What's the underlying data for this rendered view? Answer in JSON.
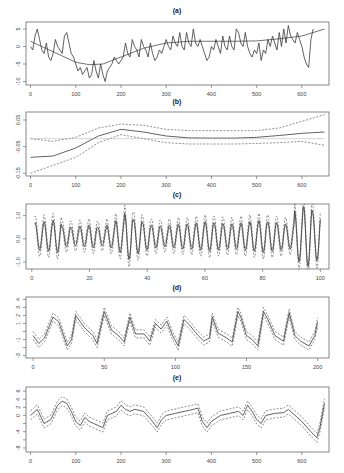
{
  "chart_data": [
    {
      "panel": "(a)",
      "type": "line",
      "title": "(a)",
      "xlabel": "",
      "ylabel": "",
      "xlim": [
        -10,
        660
      ],
      "ylim": [
        -11,
        7
      ],
      "xticks": [
        0,
        100,
        200,
        300,
        400,
        500,
        600
      ],
      "yticks": [
        5,
        0,
        -5,
        -10
      ],
      "grid": false,
      "box": {
        "x0": 26,
        "y0": 22,
        "x1": 329,
        "y1": 85
      },
      "series": [
        {
          "name": "observed",
          "style": "main",
          "x": [
            0,
            5,
            10,
            15,
            20,
            25,
            30,
            35,
            40,
            45,
            50,
            55,
            60,
            65,
            70,
            75,
            80,
            85,
            90,
            95,
            100,
            105,
            110,
            115,
            120,
            125,
            130,
            135,
            140,
            145,
            150,
            155,
            160,
            165,
            170,
            175,
            180,
            185,
            190,
            195,
            200,
            205,
            210,
            215,
            220,
            225,
            230,
            235,
            240,
            245,
            250,
            255,
            260,
            265,
            270,
            275,
            280,
            285,
            290,
            295,
            300,
            305,
            310,
            315,
            320,
            325,
            330,
            335,
            340,
            345,
            350,
            355,
            360,
            365,
            370,
            375,
            380,
            385,
            390,
            395,
            400,
            405,
            410,
            415,
            420,
            425,
            430,
            435,
            440,
            445,
            450,
            455,
            460,
            465,
            470,
            475,
            480,
            485,
            490,
            495,
            500,
            505,
            510,
            515,
            520,
            525,
            530,
            535,
            540,
            545,
            550,
            555,
            560,
            565,
            570,
            575,
            580,
            585,
            590,
            595,
            600,
            605,
            610,
            615,
            620,
            625,
            630,
            635,
            640,
            645,
            650
          ],
          "values": [
            0,
            -1,
            3,
            5,
            2,
            -1,
            -2,
            1,
            -3,
            -4,
            -2,
            2,
            0,
            -1,
            -2,
            3,
            4,
            1,
            -2,
            -3,
            -5,
            -7,
            -6,
            -8,
            -7,
            -6,
            -9,
            -8,
            -4,
            -7,
            -9,
            -5,
            -8,
            -10,
            -7,
            -6,
            -5,
            -3,
            -4,
            -5,
            -4,
            -3,
            1,
            -2,
            -3,
            2,
            0,
            -1,
            -3,
            2,
            0,
            -1,
            -3,
            1,
            -2,
            -4,
            -3,
            -1,
            -2,
            0,
            2,
            0,
            -1,
            3,
            1,
            0,
            4,
            0,
            -1,
            4,
            1,
            0,
            5,
            1,
            0,
            2,
            0,
            -2,
            -4,
            -3,
            0,
            -1,
            2,
            0,
            -2,
            3,
            0,
            -1,
            3,
            0,
            -1,
            5,
            4,
            1,
            0,
            4,
            0,
            -2,
            -3,
            -1,
            -2,
            1,
            -4,
            -1,
            -2,
            2,
            0,
            3,
            1,
            -1,
            4,
            0,
            5,
            1,
            6,
            3,
            2,
            1,
            4,
            2,
            0,
            -3,
            -5,
            -6,
            2,
            5
          ]
        },
        {
          "name": "trend",
          "style": "trend",
          "x": [
            0,
            50,
            100,
            130,
            160,
            200,
            250,
            300,
            350,
            400,
            450,
            500,
            550,
            600,
            650
          ],
          "values": [
            1.5,
            -1.5,
            -4.5,
            -5.2,
            -5,
            -3,
            -0.5,
            1,
            1.5,
            1.5,
            1.5,
            1.6,
            2.2,
            3,
            5
          ]
        }
      ]
    },
    {
      "panel": "(b)",
      "type": "line",
      "title": "(b)",
      "xlabel": "",
      "ylabel": "",
      "xlim": [
        -10,
        660
      ],
      "ylim": [
        -0.16,
        0.08
      ],
      "xticks": [
        0,
        100,
        200,
        300,
        400,
        500,
        600
      ],
      "yticks": [
        0.05,
        -0.05,
        -0.15
      ],
      "ytick_labels": [
        "0.05",
        "-0.05",
        "-0.15"
      ],
      "grid": false,
      "box": {
        "x0": 26,
        "y0": 112,
        "x1": 329,
        "y1": 176
      },
      "series": [
        {
          "name": "estimate",
          "style": "main",
          "x": [
            0,
            50,
            100,
            150,
            200,
            250,
            300,
            350,
            400,
            450,
            500,
            550,
            600,
            650
          ],
          "values": [
            -0.09,
            -0.085,
            -0.055,
            -0.01,
            0.015,
            0.005,
            -0.01,
            -0.017,
            -0.018,
            -0.018,
            -0.015,
            -0.008,
            0.0,
            0.005
          ]
        },
        {
          "name": "upper band",
          "style": "band",
          "x": [
            0,
            50,
            100,
            150,
            200,
            250,
            300,
            350,
            400,
            450,
            500,
            550,
            600,
            650
          ],
          "values": [
            -0.02,
            -0.03,
            -0.015,
            0.02,
            0.035,
            0.03,
            0.015,
            0.01,
            0.01,
            0.01,
            0.01,
            0.02,
            0.045,
            0.07
          ]
        },
        {
          "name": "lower band",
          "style": "band",
          "x": [
            0,
            50,
            100,
            150,
            200,
            250,
            300,
            350,
            400,
            450,
            500,
            550,
            600,
            650
          ],
          "values": [
            -0.15,
            -0.12,
            -0.09,
            -0.035,
            -0.005,
            -0.02,
            -0.035,
            -0.04,
            -0.04,
            -0.04,
            -0.038,
            -0.035,
            -0.03,
            -0.045
          ]
        },
        {
          "name": "zero line",
          "style": "ref",
          "x": [
            0,
            650
          ],
          "values": [
            -0.02,
            -0.02
          ]
        }
      ]
    },
    {
      "panel": "(c)",
      "type": "line",
      "title": "(c)",
      "xlabel": "",
      "ylabel": "",
      "xlim": [
        -2,
        103
      ],
      "ylim": [
        -1.3,
        1.5
      ],
      "xticks": [
        0,
        20,
        40,
        60,
        80,
        100
      ],
      "yticks": [
        1.0,
        0.0,
        -1.0
      ],
      "ytick_labels": [
        "1.0",
        "0.0",
        "-1.0"
      ],
      "grid": false,
      "box": {
        "x0": 26,
        "y0": 204,
        "x1": 329,
        "y1": 269
      },
      "seasonal_period": 3.1,
      "amplitudes": [
        0.6,
        0.65,
        0.7,
        0.45,
        0.4,
        0.45,
        0.5,
        0.4,
        0.5,
        0.7,
        1.0,
        0.75,
        0.6,
        0.5,
        0.45,
        0.5,
        0.55,
        0.55,
        0.6,
        0.65,
        0.6,
        0.55,
        0.55,
        0.6,
        0.65,
        0.7,
        0.65,
        0.6,
        0.55,
        1.1,
        1.3,
        1.05,
        0.7,
        0.6
      ],
      "band_width": 0.18
    },
    {
      "panel": "(d)",
      "type": "line",
      "title": "(d)",
      "xlabel": "",
      "ylabel": "",
      "xlim": [
        -5,
        208
      ],
      "ylim": [
        -3.3,
        4.3
      ],
      "xticks": [
        0,
        50,
        100,
        150,
        200
      ],
      "yticks": [
        4,
        3,
        2,
        1,
        0,
        -1,
        -2,
        -3
      ],
      "ytick_labels": [
        "4",
        "3",
        "2",
        "1",
        "",
        "-1",
        "",
        "-3"
      ],
      "grid": false,
      "box": {
        "x0": 26,
        "y0": 297,
        "x1": 329,
        "y1": 358
      },
      "series": [
        {
          "name": "estimate",
          "style": "main",
          "x": [
            0,
            4,
            8,
            14,
            18,
            24,
            27,
            30,
            36,
            42,
            45,
            50,
            55,
            60,
            64,
            68,
            72,
            78,
            82,
            86,
            90,
            94,
            98,
            102,
            106,
            110,
            116,
            120,
            124,
            126,
            130,
            136,
            140,
            144,
            146,
            150,
            154,
            158,
            162,
            165,
            170,
            176,
            180,
            184,
            188,
            194,
            198,
            200
          ],
          "values": [
            -0.5,
            -1.5,
            -0.8,
            1.8,
            1.2,
            -1.8,
            -1.0,
            2.0,
            0.5,
            -0.5,
            -1.5,
            2.5,
            0.2,
            -0.5,
            -1.3,
            1.8,
            -0.3,
            -0.3,
            -1.2,
            1.0,
            0.3,
            1.3,
            -0.5,
            -1.8,
            1.5,
            0.8,
            -0.5,
            -1.2,
            -0.8,
            1.8,
            -0.2,
            -0.8,
            -1.3,
            2.5,
            1.8,
            -0.5,
            -1.0,
            -1.8,
            2.5,
            1.5,
            -0.5,
            -1.2,
            2.3,
            -0.5,
            -1.2,
            -1.8,
            -0.5,
            1.2
          ]
        }
      ],
      "band_width": 0.5
    },
    {
      "panel": "(e)",
      "type": "line",
      "title": "(e)",
      "xlabel": "",
      "ylabel": "",
      "xlim": [
        -10,
        660
      ],
      "ylim": [
        -9,
        7
      ],
      "xticks": [
        0,
        100,
        200,
        300,
        400,
        500,
        600
      ],
      "yticks": [
        6,
        4,
        2,
        0,
        -2,
        -4,
        -6,
        -8
      ],
      "ytick_labels": [
        "6",
        "4",
        "2",
        "0",
        "",
        "-4",
        "",
        "-8"
      ],
      "grid": false,
      "box": {
        "x0": 26,
        "y0": 387,
        "x1": 329,
        "y1": 452
      },
      "series": [
        {
          "name": "estimate",
          "style": "main",
          "x": [
            0,
            15,
            30,
            45,
            60,
            70,
            80,
            90,
            100,
            110,
            120,
            130,
            140,
            160,
            170,
            180,
            190,
            200,
            210,
            220,
            230,
            250,
            270,
            280,
            290,
            300,
            320,
            340,
            360,
            370,
            380,
            390,
            400,
            420,
            440,
            460,
            470,
            480,
            490,
            500,
            510,
            520,
            540,
            560,
            570,
            580,
            590,
            600,
            620,
            633,
            640,
            650
          ],
          "values": [
            0,
            1.5,
            -2,
            -1,
            2.5,
            3.5,
            3,
            1,
            -1.5,
            -2.5,
            -0.5,
            -1.5,
            -2,
            -3,
            0,
            0.5,
            1,
            2.5,
            1.5,
            1,
            1.5,
            1,
            -1.5,
            -3,
            -1,
            0,
            0.5,
            1,
            1.5,
            1.8,
            -1.5,
            -3,
            -1.5,
            0,
            0.5,
            1,
            0,
            2.5,
            1,
            -1,
            -2,
            0,
            0.5,
            0.7,
            1.5,
            0.5,
            -0.5,
            -1.5,
            -4,
            -5.5,
            -3,
            3
          ]
        }
      ],
      "band_width": 1.1
    }
  ]
}
